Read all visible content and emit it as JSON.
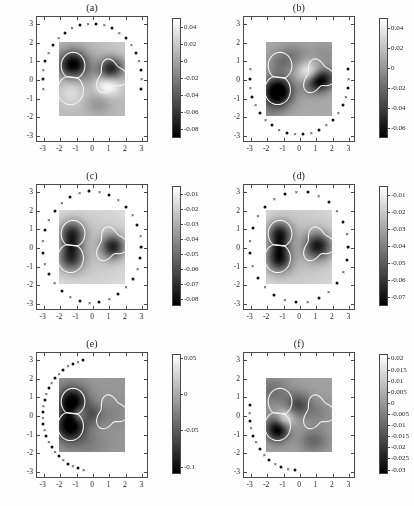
{
  "figure": {
    "width": 414,
    "height": 506,
    "background": "#ffffff",
    "colormap": "gray",
    "layout": "3 rows x 2 columns of heatmap panels with individual colorbars"
  },
  "chart_data": [
    {
      "type": "heatmap",
      "title": "(a)",
      "xlabel": "",
      "ylabel": "",
      "xlim": [
        -3.4,
        3.4
      ],
      "ylim": [
        -3.4,
        3.4
      ],
      "xticks": [
        -3,
        -2,
        -1,
        0,
        1,
        2,
        3
      ],
      "yticks": [
        -3,
        -2,
        -1,
        0,
        1,
        2,
        3
      ],
      "xticklabels": [
        "-3",
        "-2",
        "-1",
        "0",
        "1",
        "2",
        "3"
      ],
      "yticklabels": [
        "-3",
        "-2",
        "-1",
        "0",
        "1",
        "2",
        "3"
      ],
      "grid": false,
      "legend": null,
      "colorbar": {
        "ticks": [
          0.04,
          0.02,
          0,
          -0.02,
          -0.04,
          -0.06,
          -0.08
        ],
        "ticklabels": [
          "0.04",
          "0.02",
          "0",
          "-0.02",
          "-0.04",
          "-0.06",
          "-0.08"
        ],
        "vmin": -0.09,
        "vmax": 0.05,
        "position": "right"
      },
      "image_extent": [
        -2.0,
        2.0,
        -2.0,
        2.0
      ],
      "sensors": {
        "description": "measurement points on circle radius 3, upper arc",
        "arc_start_deg": -10,
        "arc_end_deg": 190,
        "count": 22,
        "radius": 3.0,
        "markers": [
          "dot",
          "cross"
        ]
      },
      "contours": [
        "figure-eight-left",
        "kidney-right"
      ],
      "reconstruction_note": "two dark inclusions reconstructed, left figure-eight and right kidney"
    },
    {
      "type": "heatmap",
      "title": "(b)",
      "xlabel": "",
      "ylabel": "",
      "xlim": [
        -3.4,
        3.4
      ],
      "ylim": [
        -3.4,
        3.4
      ],
      "xticks": [
        -3,
        -2,
        -1,
        0,
        1,
        2,
        3
      ],
      "yticks": [
        -3,
        -2,
        -1,
        0,
        1,
        2,
        3
      ],
      "xticklabels": [
        "-3",
        "-2",
        "-1",
        "0",
        "1",
        "2",
        "3"
      ],
      "yticklabels": [
        "-3",
        "-2",
        "-1",
        "0",
        "1",
        "2",
        "3"
      ],
      "grid": false,
      "legend": null,
      "colorbar": {
        "ticks": [
          0.04,
          0.02,
          0,
          -0.02,
          -0.04,
          -0.06
        ],
        "ticklabels": [
          "0.04",
          "0.02",
          "0",
          "-0.02",
          "-0.04",
          "-0.06"
        ],
        "vmin": -0.07,
        "vmax": 0.05,
        "position": "right"
      },
      "image_extent": [
        -2.0,
        2.0,
        -2.0,
        2.0
      ],
      "sensors": {
        "description": "measurement points on circle radius 3, lower arc",
        "arc_start_deg": 10,
        "arc_end_deg": -190,
        "count": 22,
        "radius": 3.0,
        "markers": [
          "dot",
          "cross"
        ]
      },
      "contours": [
        "figure-eight-left",
        "kidney-right"
      ],
      "reconstruction_note": "dark inclusion concentrated at lower lobe of figure-eight and right kidney"
    },
    {
      "type": "heatmap",
      "title": "(c)",
      "xlabel": "",
      "ylabel": "",
      "xlim": [
        -3.4,
        3.4
      ],
      "ylim": [
        -3.4,
        3.4
      ],
      "xticks": [
        -3,
        -2,
        -1,
        0,
        1,
        2,
        3
      ],
      "yticks": [
        -3,
        -2,
        -1,
        0,
        1,
        2,
        3
      ],
      "xticklabels": [
        "-3",
        "-2",
        "-1",
        "0",
        "1",
        "2",
        "3"
      ],
      "yticklabels": [
        "-3",
        "-2",
        "-1",
        "0",
        "1",
        "2",
        "3"
      ],
      "grid": false,
      "legend": null,
      "colorbar": {
        "ticks": [
          -0.01,
          -0.02,
          -0.03,
          -0.04,
          -0.05,
          -0.06,
          -0.07,
          -0.08
        ],
        "ticklabels": [
          "-0.01",
          "-0.02",
          "-0.03",
          "-0.04",
          "-0.05",
          "-0.06",
          "-0.07",
          "-0.08"
        ],
        "vmin": -0.085,
        "vmax": -0.005,
        "position": "right"
      },
      "image_extent": [
        -2.0,
        2.0,
        -2.0,
        2.0
      ],
      "sensors": {
        "description": "measurement points on full circle radius 3",
        "arc_start_deg": 0,
        "arc_end_deg": 360,
        "count": 32,
        "radius": 3.0,
        "markers": [
          "dot",
          "cross"
        ]
      },
      "contours": [
        "figure-eight-left",
        "kidney-right"
      ],
      "reconstruction_note": "both inclusions resolved symmetrically with full aperture data"
    },
    {
      "type": "heatmap",
      "title": "(d)",
      "xlabel": "",
      "ylabel": "",
      "xlim": [
        -3.4,
        3.4
      ],
      "ylim": [
        -3.4,
        3.4
      ],
      "xticks": [
        -3,
        -2,
        -1,
        0,
        1,
        2,
        3
      ],
      "yticks": [
        -3,
        -2,
        -1,
        0,
        1,
        2,
        3
      ],
      "xticklabels": [
        "-3",
        "-2",
        "-1",
        "0",
        "1",
        "2",
        "3"
      ],
      "yticklabels": [
        "-3",
        "-2",
        "-1",
        "0",
        "1",
        "2",
        "3"
      ],
      "grid": false,
      "legend": null,
      "colorbar": {
        "ticks": [
          -0.01,
          -0.02,
          -0.03,
          -0.04,
          -0.05,
          -0.06,
          -0.07
        ],
        "ticklabels": [
          "-0.01",
          "-0.02",
          "-0.03",
          "-0.04",
          "-0.05",
          "-0.06",
          "-0.07"
        ],
        "vmin": -0.075,
        "vmax": -0.005,
        "position": "right"
      },
      "image_extent": [
        -2.0,
        2.0,
        -2.0,
        2.0
      ],
      "sensors": {
        "description": "measurement points on full circle radius 3, sparser sampling",
        "arc_start_deg": 0,
        "arc_end_deg": 360,
        "count": 28,
        "radius": 3.0,
        "markers": [
          "dot",
          "cross"
        ]
      },
      "contours": [
        "figure-eight-left",
        "kidney-right"
      ],
      "reconstruction_note": "both inclusions resolved, slightly blurred right blob"
    },
    {
      "type": "heatmap",
      "title": "(e)",
      "xlabel": "",
      "ylabel": "",
      "xlim": [
        -3.4,
        3.4
      ],
      "ylim": [
        -3.4,
        3.4
      ],
      "xticks": [
        -3,
        -2,
        -1,
        0,
        1,
        2,
        3
      ],
      "yticks": [
        -3,
        -2,
        -1,
        0,
        1,
        2,
        3
      ],
      "xticklabels": [
        "-3",
        "-2",
        "-1",
        "0",
        "1",
        "2",
        "3"
      ],
      "yticklabels": [
        "-3",
        "-2",
        "-1",
        "0",
        "1",
        "2",
        "3"
      ],
      "grid": false,
      "legend": null,
      "colorbar": {
        "ticks": [
          0.05,
          0,
          -0.05,
          -0.1
        ],
        "ticklabels": [
          "0.05",
          "0",
          "-0.05",
          "-0.1"
        ],
        "vmin": -0.11,
        "vmax": 0.055,
        "position": "right"
      },
      "image_extent": [
        -2.0,
        2.0,
        -2.0,
        2.0
      ],
      "sensors": {
        "description": "measurement points on circle radius 3, left arc",
        "arc_start_deg": 100,
        "arc_end_deg": 260,
        "count": 26,
        "radius": 3.0,
        "markers": [
          "dot",
          "cross"
        ]
      },
      "contours": [
        "figure-eight-left",
        "kidney-right"
      ],
      "reconstruction_note": "left figure-eight strongly reconstructed, right blob faint"
    },
    {
      "type": "heatmap",
      "title": "(f)",
      "xlabel": "",
      "ylabel": "",
      "xlim": [
        -3.4,
        3.4
      ],
      "ylim": [
        -3.4,
        3.4
      ],
      "xticks": [
        -3,
        -2,
        -1,
        0,
        1,
        2,
        3
      ],
      "yticks": [
        -3,
        -2,
        -1,
        0,
        1,
        2,
        3
      ],
      "xticklabels": [
        "-3",
        "-2",
        "-1",
        "0",
        "1",
        "2",
        "3"
      ],
      "yticklabels": [
        "-3",
        "-2",
        "-1",
        "0",
        "1",
        "2",
        "3"
      ],
      "grid": false,
      "legend": null,
      "colorbar": {
        "ticks": [
          0.02,
          0.015,
          0.01,
          0.005,
          0,
          -0.005,
          -0.01,
          -0.015,
          -0.02,
          -0.025,
          -0.03
        ],
        "ticklabels": [
          "0.02",
          "0.015",
          "0.01",
          "0.005",
          "0",
          "-0.005",
          "-0.01",
          "-0.015",
          "-0.02",
          "-0.025",
          "-0.03"
        ],
        "vmin": -0.032,
        "vmax": 0.022,
        "position": "right"
      },
      "image_extent": [
        -2.0,
        2.0,
        -2.0,
        2.0
      ],
      "sensors": {
        "description": "measurement points on circle radius 3, lower-left quarter arc",
        "arc_start_deg": 170,
        "arc_end_deg": 265,
        "count": 13,
        "radius": 3.0,
        "markers": [
          "dot",
          "cross"
        ]
      },
      "contours": [
        "figure-eight-left",
        "kidney-right"
      ],
      "reconstruction_note": "only lower lobe of figure-eight strongly reconstructed"
    }
  ]
}
